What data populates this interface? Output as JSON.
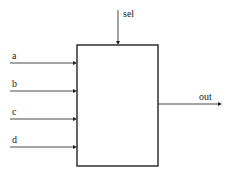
{
  "diagram": {
    "type": "block-diagram",
    "block": {
      "label": "",
      "x": 77,
      "y": 45,
      "width": 81,
      "height": 121
    },
    "select": {
      "label": "sel",
      "x": 118,
      "y_start": 10,
      "y_end": 45
    },
    "inputs": [
      {
        "label": "a",
        "y": 63
      },
      {
        "label": "b",
        "y": 91
      },
      {
        "label": "c",
        "y": 119
      },
      {
        "label": "d",
        "y": 147
      }
    ],
    "output": {
      "label": "out",
      "y": 104,
      "x_start": 158,
      "x_end": 222
    },
    "colors": {
      "stroke": "#222222",
      "background": "#ffffff"
    }
  }
}
